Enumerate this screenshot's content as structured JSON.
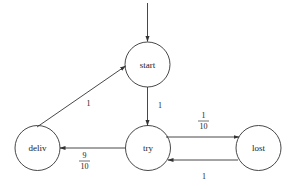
{
  "diagram": {
    "type": "markov-chain",
    "states": [
      {
        "id": "start",
        "label": "start",
        "cx": 147.5,
        "cy": 64.5
      },
      {
        "id": "try",
        "label": "try",
        "cx": 148,
        "cy": 148
      },
      {
        "id": "deliv",
        "label": "deliv",
        "cx": 37.5,
        "cy": 148
      },
      {
        "id": "lost",
        "label": "lost",
        "cx": 258.5,
        "cy": 148
      }
    ],
    "edges": [
      {
        "from": "init",
        "to": "start",
        "label": ""
      },
      {
        "from": "start",
        "to": "try",
        "label": "1"
      },
      {
        "from": "try",
        "to": "lost",
        "label_num": "1",
        "label_den": "10"
      },
      {
        "from": "lost",
        "to": "try",
        "label": "1"
      },
      {
        "from": "try",
        "to": "deliv",
        "label_num": "9",
        "label_den": "10"
      },
      {
        "from": "deliv",
        "to": "start",
        "label": "1"
      }
    ]
  }
}
